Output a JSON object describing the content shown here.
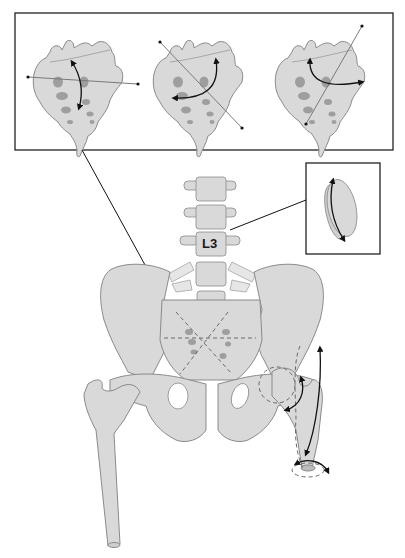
{
  "diagram": {
    "type": "anatomical-illustration",
    "colors": {
      "bone_fill": "#d9d9d9",
      "bone_stroke": "#8a8a8a",
      "spot_fill": "#9e9e9e",
      "axis_line": "#7a7a7a",
      "arrow": "#111111",
      "frame": "#222222",
      "background": "#ffffff"
    },
    "labels": {
      "vertebra": "L3"
    },
    "panels": [
      {
        "id": "sacrum-view-1",
        "axis": "horizontal",
        "rotation": "vertical arc"
      },
      {
        "id": "sacrum-view-2",
        "axis": "diagonal top-left to bottom-right",
        "rotation": "curved arc"
      },
      {
        "id": "sacrum-view-3",
        "axis": "diagonal bottom-left to top-right",
        "rotation": "horizontal arc"
      }
    ],
    "inset": {
      "id": "intervertebral-disc",
      "rotation": "axial arc"
    },
    "callouts": [
      {
        "from": "sacrum-panel",
        "to": "sacrum"
      },
      {
        "from": "disc-inset",
        "to": "L3 disc"
      }
    ],
    "hip": {
      "motions": [
        "flexion-extension arc",
        "rotation arc at femoral head",
        "axial rotation at femoral shaft"
      ]
    }
  }
}
